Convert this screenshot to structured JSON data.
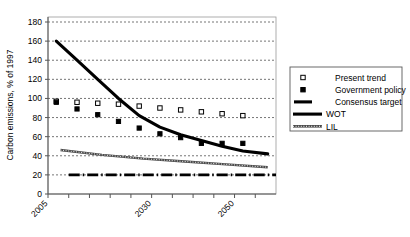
{
  "chart_data": {
    "type": "line",
    "title": "",
    "xlabel": "",
    "ylabel": "Carbon emissions, % of 1997",
    "ylim": [
      0,
      180
    ],
    "ytick_values": [
      0,
      20,
      40,
      60,
      80,
      100,
      120,
      140,
      160,
      180
    ],
    "ytick_labels": [
      "0",
      "20",
      "40",
      "60",
      "80",
      "100",
      "120",
      "140",
      "160",
      "180"
    ],
    "xlim": [
      2005,
      2060
    ],
    "xtick_values": [
      2005,
      2010,
      2015,
      2020,
      2025,
      2030,
      2035,
      2040,
      2045,
      2050,
      2055
    ],
    "xtick_labels": [
      "2005",
      "",
      "",
      "",
      "",
      "2030",
      "",
      "",
      "",
      "2050",
      ""
    ],
    "xtick_labels_shown": [
      "2005",
      "2030",
      "2050"
    ],
    "grid": "horizontal-dashed",
    "legend_position": "right-outside",
    "series": [
      {
        "name": "Present trend",
        "style": "open-square-markers",
        "marker": "open-square",
        "color": "#000000",
        "x": [
          2007,
          2012,
          2017,
          2022,
          2027,
          2032,
          2037,
          2042,
          2047,
          2052
        ],
        "values": [
          97,
          96,
          95,
          94,
          92,
          90,
          88,
          86,
          84,
          82
        ]
      },
      {
        "name": "Government policy",
        "style": "filled-square-markers",
        "marker": "filled-square",
        "color": "#000000",
        "x": [
          2007,
          2012,
          2017,
          2022,
          2027,
          2032,
          2037,
          2042,
          2047,
          2052
        ],
        "values": [
          96,
          89,
          83,
          76,
          69,
          63,
          59,
          53,
          53,
          53
        ]
      },
      {
        "name": "Consensus target",
        "style": "thick-dash-dot-line",
        "color": "#000000",
        "x": [
          2010,
          2060
        ],
        "values": [
          20,
          20
        ]
      },
      {
        "name": "WOT",
        "style": "thick-solid-line",
        "color": "#000000",
        "x": [
          2007,
          2012,
          2017,
          2022,
          2027,
          2032,
          2037,
          2042,
          2047,
          2052,
          2058
        ],
        "values": [
          160,
          140,
          120,
          100,
          82,
          70,
          62,
          56,
          50,
          45,
          42
        ]
      },
      {
        "name": "LIL",
        "style": "hatched-line",
        "color": "#4a4a4a",
        "x": [
          2008,
          2018,
          2028,
          2038,
          2048,
          2058
        ],
        "values": [
          46,
          41,
          37,
          34,
          31,
          28
        ]
      }
    ]
  },
  "legend": {
    "items": [
      {
        "label": "Present trend",
        "marker": "open-square"
      },
      {
        "label": "Government policy",
        "marker": "filled-square"
      },
      {
        "label": "Consensus target",
        "marker": "thick-dash"
      },
      {
        "label": "WOT",
        "marker": "thick-line"
      },
      {
        "label": "LIL",
        "marker": "hatched-line"
      }
    ]
  }
}
